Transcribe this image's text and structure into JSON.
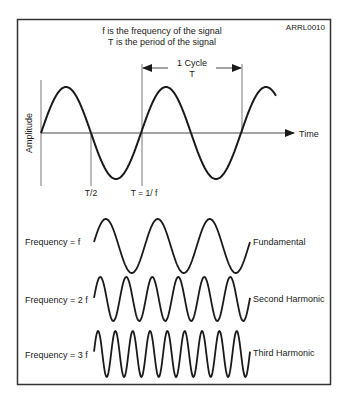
{
  "figure_id": "ARRL0010",
  "title_lines": [
    "f is the frequency of the signal",
    "T is the period of the signal"
  ],
  "main_plot": {
    "cycle_label_1": "1 Cycle",
    "cycle_label_2": "T",
    "y_axis_label": "Amplitude",
    "x_axis_label": "Time",
    "half_period_label": "T/2",
    "period_label": "T = 1/ f"
  },
  "harmonics": [
    {
      "left_label": "Frequency = f",
      "right_label": "Fundamental",
      "cycles": 3
    },
    {
      "left_label": "Frequency = 2 f",
      "right_label": "Second Harmonic",
      "cycles": 6
    },
    {
      "left_label": "Frequency = 3 f",
      "right_label": "Third Harmonic",
      "cycles": 9
    }
  ],
  "colors": {
    "stroke": "#1a1a1a",
    "thin": "#555555",
    "border": "#333333"
  }
}
